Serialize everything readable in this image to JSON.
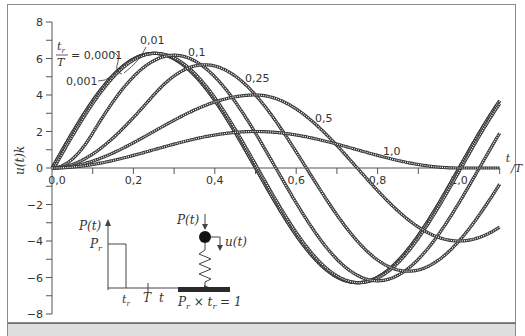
{
  "chart_data": {
    "type": "line",
    "title": "",
    "xlabel": "t/T",
    "ylabel": "u(t)k",
    "xlim": [
      0.0,
      1.1
    ],
    "ylim": [
      -8,
      8
    ],
    "x_ticks": [
      0.0,
      0.1,
      0.2,
      0.3,
      0.4,
      0.5,
      0.6,
      0.7,
      0.8,
      0.9,
      1.0,
      1.1
    ],
    "x_tick_labels": [
      "0,0",
      "",
      "0,2",
      "",
      "0,4",
      "",
      "0,6",
      "",
      "0,8",
      "",
      "1,0",
      ""
    ],
    "y_ticks": [
      -8,
      -7,
      -6,
      -5,
      -4,
      -3,
      -2,
      -1,
      0,
      1,
      2,
      3,
      4,
      5,
      6,
      7,
      8
    ],
    "y_tick_labels": [
      "-8",
      "",
      "-6",
      "",
      "-4",
      "",
      "-2",
      "",
      "0",
      "",
      "2",
      "",
      "4",
      "",
      "6",
      "",
      "8"
    ],
    "grid": false,
    "legend_title": "tr/T =",
    "series": [
      {
        "name": "0,0001",
        "tr_over_T": 0.0001,
        "peak": 6.28,
        "peak_at": 0.25,
        "min": -6.28,
        "min_at": 0.75
      },
      {
        "name": "0,001",
        "tr_over_T": 0.001,
        "peak": 6.28,
        "peak_at": 0.25,
        "min": -6.28,
        "min_at": 0.75
      },
      {
        "name": "0,01",
        "tr_over_T": 0.01,
        "peak": 6.28,
        "peak_at": 0.255,
        "min": -6.28,
        "min_at": 0.755
      },
      {
        "name": "0,1",
        "tr_over_T": 0.1,
        "peak": 6.18,
        "peak_at": 0.3,
        "min": -6.18,
        "min_at": 0.8
      },
      {
        "name": "0,25",
        "tr_over_T": 0.25,
        "peak": 5.66,
        "peak_at": 0.375,
        "min": -5.66,
        "min_at": 0.875
      },
      {
        "name": "0,5",
        "tr_over_T": 0.5,
        "peak": 4.0,
        "peak_at": 0.5,
        "min": -4.0,
        "min_at": 1.0
      },
      {
        "name": "1,0",
        "tr_over_T": 1.0,
        "peak": 2.0,
        "peak_at": 0.5,
        "min": 0.0,
        "min_at": 1.0
      }
    ],
    "annotations": [
      "0,0001",
      "0,001",
      "0,01",
      "0,1",
      "0,25",
      "0,5",
      "1,0"
    ]
  },
  "inset": {
    "load_plot": {
      "y_label": "P(t)",
      "level_label": "Pr",
      "x_label": "t",
      "tr_label": "tr",
      "T_label": "T"
    },
    "system": {
      "force_label": "P(t)",
      "disp_label": "u(t)",
      "impulse_label": "Pr × tr = 1"
    }
  },
  "colors": {
    "curve": "#3a3a3a",
    "curve_hatch": "#ffffff",
    "axis": "#555555",
    "band": "#dedede"
  }
}
